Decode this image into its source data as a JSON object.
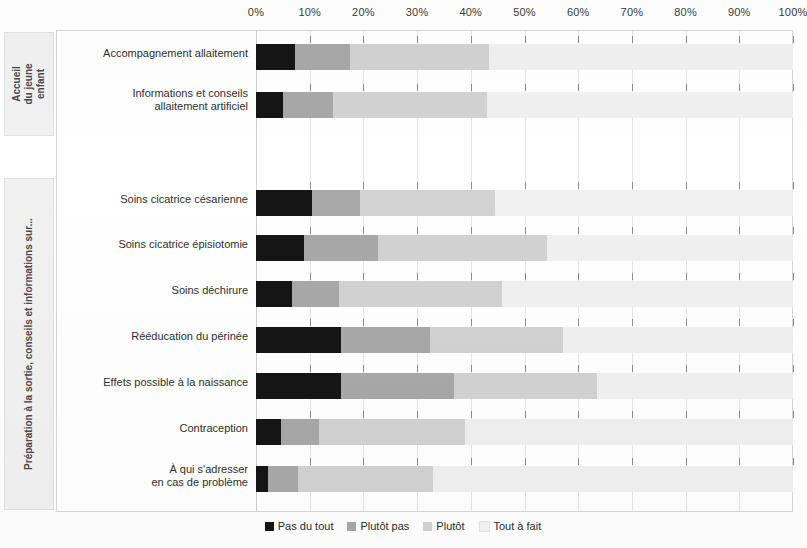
{
  "chart_data": {
    "type": "bar",
    "orientation": "horizontal",
    "stacked": true,
    "normalized_percent": true,
    "title": "",
    "subtitle": "",
    "xlabel": "",
    "ylabel": "",
    "xlim": [
      0,
      100
    ],
    "xticks": [
      "0%",
      "10%",
      "20%",
      "30%",
      "40%",
      "50%",
      "60%",
      "70%",
      "80%",
      "90%",
      "100%"
    ],
    "xtick_values": [
      0,
      10,
      20,
      30,
      40,
      50,
      60,
      70,
      80,
      90,
      100
    ],
    "grid": true,
    "legend_position": "bottom",
    "series": [
      {
        "name": "Pas du tout",
        "color": "#151515",
        "values": [
          7.3,
          5.1,
          10.4,
          9.0,
          6.7,
          15.8,
          15.8,
          4.7,
          2.2
        ]
      },
      {
        "name": "Plutôt pas",
        "color": "#a8a8a8",
        "values": [
          10.2,
          9.2,
          9.0,
          13.7,
          8.8,
          16.6,
          21.1,
          7.1,
          5.6
        ]
      },
      {
        "name": "Plutôt",
        "color": "#d2d2d2",
        "values": [
          25.9,
          28.7,
          25.1,
          31.5,
          30.3,
          24.8,
          26.6,
          27.1,
          25.2
        ]
      },
      {
        "name": "Tout à fait",
        "color": "#f0f0f0",
        "values": [
          56.6,
          57.0,
          55.5,
          45.8,
          54.2,
          42.8,
          36.5,
          61.1,
          67.0
        ]
      }
    ],
    "categories": [
      "Accompagnement allaitement",
      "Informations et conseils allaitement artificiel",
      "Soins cicatrice césarienne",
      "Soins cicatrice épisiotomie",
      "Soins déchirure",
      "Rééducation du périnée",
      "Effets possible à la naissance",
      "Contraception",
      "À qui s'adresser en cas de problème"
    ]
  },
  "axis": {
    "ticks": [
      {
        "label": "0%",
        "value": 0
      },
      {
        "label": "10%",
        "value": 10
      },
      {
        "label": "20%",
        "value": 20
      },
      {
        "label": "30%",
        "value": 30
      },
      {
        "label": "40%",
        "value": 40
      },
      {
        "label": "50%",
        "value": 50
      },
      {
        "label": "60%",
        "value": 60
      },
      {
        "label": "70%",
        "value": 70
      },
      {
        "label": "80%",
        "value": 80
      },
      {
        "label": "90%",
        "value": 90
      },
      {
        "label": "100%",
        "value": 100
      }
    ]
  },
  "groups": [
    {
      "id": "accueil-du-jeune-enfant",
      "label": "Accueil\ndu jeune enfant",
      "label_line1": "Accueil",
      "label_line2": "du jeune enfant",
      "rows": [
        0,
        1
      ]
    },
    {
      "id": "preparation-a-la-sortie",
      "label": "Préparation à la sortie, conseils et informations sur...",
      "rows": [
        2,
        3,
        4,
        5,
        6,
        7,
        8
      ]
    }
  ],
  "rows": [
    {
      "label": "Accompagnement allaitement",
      "label_line1": "Accompagnement allaitement",
      "label_line2": "",
      "group": "accueil-du-jeune-enfant",
      "segments": [
        7.3,
        10.2,
        25.9,
        56.6
      ]
    },
    {
      "label": "Informations et conseils allaitement artificiel",
      "label_line1": "Informations et conseils",
      "label_line2": "allaitement artificiel",
      "group": "accueil-du-jeune-enfant",
      "segments": [
        5.1,
        9.2,
        28.7,
        57.0
      ]
    },
    {
      "label": "Soins cicatrice césarienne",
      "label_line1": "Soins cicatrice césarienne",
      "label_line2": "",
      "group": "preparation-a-la-sortie",
      "segments": [
        10.4,
        9.0,
        25.1,
        55.5
      ]
    },
    {
      "label": "Soins cicatrice épisiotomie",
      "label_line1": "Soins cicatrice épisiotomie",
      "label_line2": "",
      "group": "preparation-a-la-sortie",
      "segments": [
        9.0,
        13.7,
        31.5,
        45.8
      ]
    },
    {
      "label": "Soins déchirure",
      "label_line1": "Soins déchirure",
      "label_line2": "",
      "group": "preparation-a-la-sortie",
      "segments": [
        6.7,
        8.8,
        30.3,
        54.2
      ]
    },
    {
      "label": "Rééducation du périnée",
      "label_line1": "Rééducation du périnée",
      "label_line2": "",
      "group": "preparation-a-la-sortie",
      "segments": [
        15.8,
        16.6,
        24.8,
        42.8
      ]
    },
    {
      "label": "Effets possible à la naissance",
      "label_line1": "Effets possible à la naissance",
      "label_line2": "",
      "group": "preparation-a-la-sortie",
      "segments": [
        15.8,
        21.1,
        26.6,
        36.5
      ]
    },
    {
      "label": "Contraception",
      "label_line1": "Contraception",
      "label_line2": "",
      "group": "preparation-a-la-sortie",
      "segments": [
        4.7,
        7.1,
        27.1,
        61.1
      ]
    },
    {
      "label": "À qui s'adresser en cas de problème",
      "label_line1": "À qui s'adresser",
      "label_line2": "en cas de problème",
      "group": "preparation-a-la-sortie",
      "segments": [
        2.2,
        5.6,
        25.2,
        67.0
      ]
    }
  ],
  "legend": {
    "items": [
      {
        "label": "Pas du tout",
        "color": "#151515",
        "swatch": "s0"
      },
      {
        "label": "Plutôt pas",
        "color": "#a8a8a8",
        "swatch": "s1"
      },
      {
        "label": "Plutôt",
        "color": "#d2d2d2",
        "swatch": "s2"
      },
      {
        "label": "Tout à fait",
        "color": "#f0f0f0",
        "swatch": "s3"
      }
    ]
  },
  "colors": {
    "pas_du_tout": "#151515",
    "plutot_pas": "#a8a8a8",
    "plutot": "#d2d2d2",
    "tout_a_fait": "#f0f0f0",
    "grid": "#e4e4e4",
    "frame": "#d6d6d6"
  }
}
